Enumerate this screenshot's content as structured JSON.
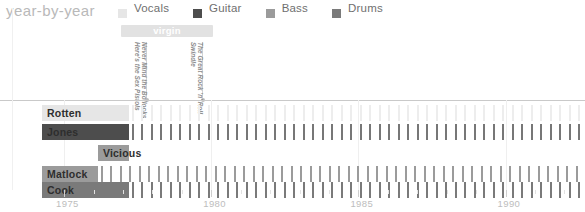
{
  "header": {
    "title": "year-by-year"
  },
  "legend": {
    "items": [
      {
        "label": "Vocals",
        "color": "#e6e6e6",
        "icon": "square-swatch-icon"
      },
      {
        "label": "Guitar",
        "color": "#4d4d4d",
        "icon": "square-swatch-icon"
      },
      {
        "label": "Bass",
        "color": "#9b9b9b",
        "icon": "square-swatch-icon"
      },
      {
        "label": "Drums",
        "color": "#7a7a7a",
        "icon": "square-swatch-icon"
      }
    ]
  },
  "label_bands": [
    {
      "name": "virgin",
      "start_year": 1976.95,
      "end_year": 1980.05,
      "color": "#e2e2e2"
    }
  ],
  "albums": [
    {
      "title_lines": [
        "Never Mind the Bollocks",
        "Here's the Sex Pistols"
      ],
      "year": 1977.8
    },
    {
      "title_lines": [
        "The Great Rock 'n' Roll",
        "Swindle"
      ],
      "year": 1979.7
    }
  ],
  "chart_data": {
    "type": "bar",
    "title": "year-by-year",
    "xlabel": "",
    "ylabel": "",
    "xlim": [
      1974.25,
      1992.7
    ],
    "grid": true,
    "legend_position": "top-right",
    "xticks_major": [
      1975,
      1980,
      1985,
      1990
    ],
    "xtick_labels": [
      "1975",
      "1980",
      "1985",
      "1990"
    ],
    "xticks_minor_step": 1,
    "categories": [
      "Rotten",
      "Jones",
      "Vicious",
      "Matlock",
      "Cook"
    ],
    "series": [
      {
        "name": "Rotten",
        "role": "Vocals",
        "color": "#e6e6e6",
        "solid_span": [
          1974.25,
          1977.2
        ],
        "dashed_span": [
          1977.2,
          1992.7
        ],
        "tick_color": "#ededed"
      },
      {
        "name": "Jones",
        "role": "Guitar",
        "color": "#4d4d4d",
        "solid_span": [
          1974.25,
          1977.2
        ],
        "dashed_span": [
          1977.2,
          1992.7
        ],
        "tick_color": "#777777"
      },
      {
        "name": "Vicious",
        "role": "Bass",
        "color": "#9b9b9b",
        "solid_span": [
          1976.15,
          1977.2
        ],
        "dashed_span": [],
        "tick_color": "#9b9b9b"
      },
      {
        "name": "Matlock",
        "role": "Bass",
        "color": "#9b9b9b",
        "solid_span": [
          1974.25,
          1976.15
        ],
        "dashed_span": [
          1976.15,
          1992.7
        ],
        "tick_color": "#9b9b9b"
      },
      {
        "name": "Cook",
        "role": "Drums",
        "color": "#7a7a7a",
        "solid_span": [
          1974.25,
          1977.2
        ],
        "dashed_span": [
          1977.2,
          1992.7
        ],
        "tick_color": "#7a7a7a"
      }
    ]
  }
}
